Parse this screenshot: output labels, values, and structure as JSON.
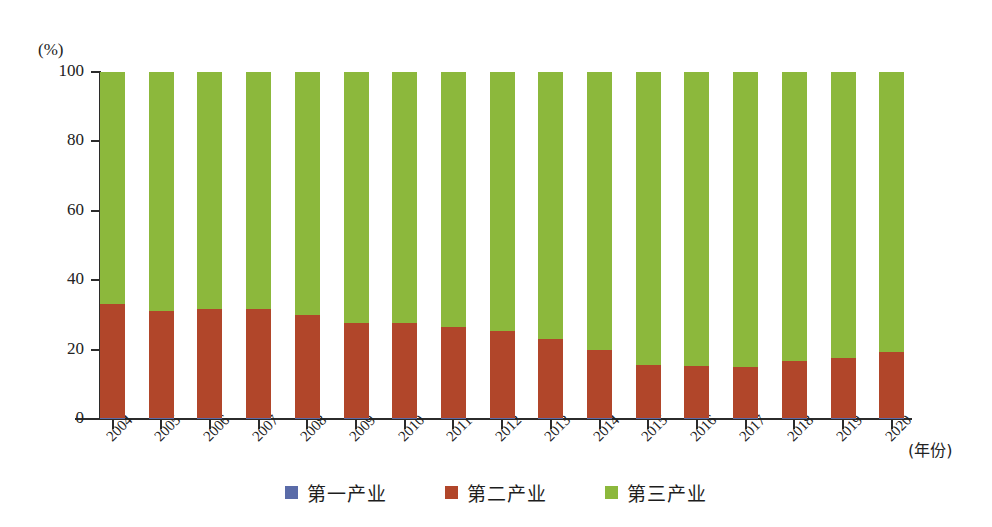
{
  "chart_data": {
    "type": "bar",
    "title": "",
    "subtitle": "",
    "xlabel": "(年份)",
    "ylabel": "(%)",
    "stacked": true,
    "stack_total": 100,
    "grid": false,
    "legend_position": "bottom",
    "ylim": [
      0,
      100
    ],
    "ytick_labels": [
      "0",
      "20",
      "40",
      "60",
      "80",
      "100"
    ],
    "ytick_values": [
      0,
      20,
      40,
      60,
      80,
      100
    ],
    "categories": [
      "2004",
      "2005",
      "2006",
      "2007",
      "2008",
      "2009",
      "2010",
      "2011",
      "2012",
      "2013",
      "2014",
      "2015",
      "2016",
      "2017",
      "2018",
      "2019",
      "2020"
    ],
    "series": [
      {
        "name": "第一产业",
        "color": "#5a6ba8",
        "values": [
          0.2,
          0.2,
          0.2,
          0.2,
          0.2,
          0.2,
          0.2,
          0.2,
          0.2,
          0.2,
          0.2,
          0.2,
          0.2,
          0.2,
          0.2,
          0.2,
          0.2
        ]
      },
      {
        "name": "第二产业",
        "color": "#b1462a",
        "values": [
          33.0,
          31.0,
          31.4,
          31.6,
          29.8,
          27.6,
          27.6,
          26.4,
          25.2,
          22.8,
          19.8,
          15.5,
          15.1,
          14.8,
          16.4,
          17.5,
          19.0
        ]
      },
      {
        "name": "第三产业",
        "color": "#8cb83c",
        "values": [
          66.8,
          68.8,
          68.4,
          68.2,
          70.0,
          72.2,
          72.2,
          73.4,
          74.6,
          77.0,
          80.0,
          84.3,
          84.7,
          85.0,
          83.4,
          82.3,
          80.8
        ]
      }
    ]
  },
  "legend": {
    "items": [
      {
        "label": "第一产业",
        "color": "#5a6ba8"
      },
      {
        "label": "第二产业",
        "color": "#b1462a"
      },
      {
        "label": "第三产业",
        "color": "#8cb83c"
      }
    ]
  },
  "axes": {
    "y_unit": "(%)",
    "x_title": "(年份)"
  }
}
